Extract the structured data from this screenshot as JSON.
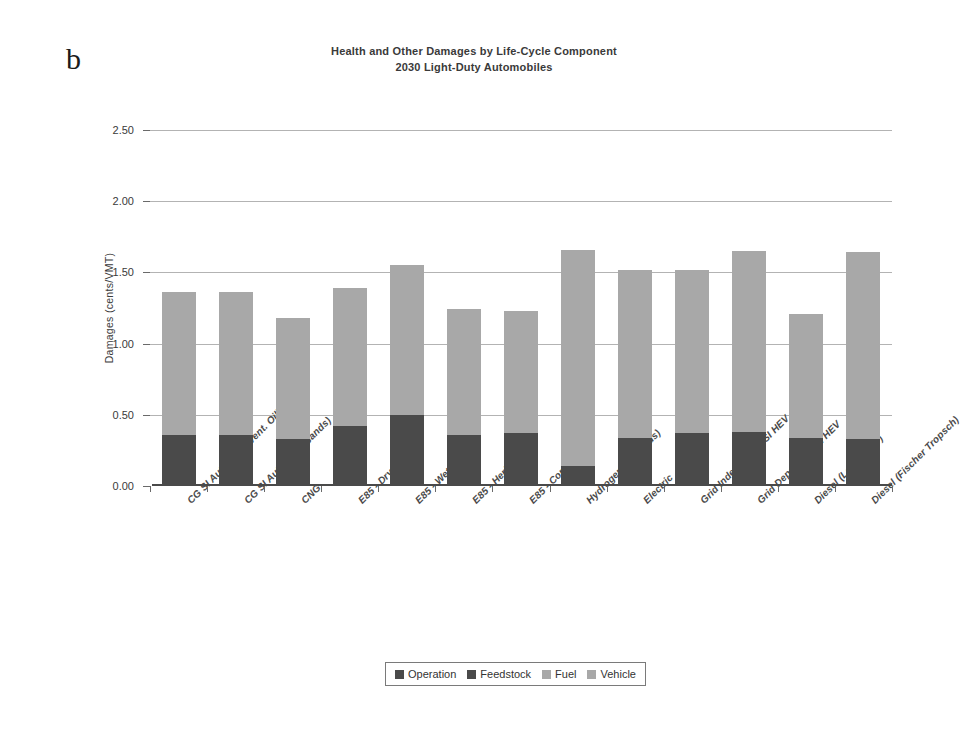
{
  "panel_label": "b",
  "title": {
    "line1": "Health and Other Damages by Life-Cycle Component",
    "line2": "2030 Light-Duty Automobiles"
  },
  "legend_position": "bottom-center",
  "chart_data": {
    "type": "bar",
    "subtype": "stacked-bar",
    "title": "Health and Other Damages by Life-Cycle Component\n2030 Light-Duty Automobiles",
    "xlabel": "",
    "ylabel": "Damages (cents/VMT)",
    "ylim": [
      0.0,
      2.5
    ],
    "ytick_labels": [
      "0.00",
      "0.50",
      "1.00",
      "1.50",
      "2.00",
      "2.50"
    ],
    "ytick_values": [
      0.0,
      0.5,
      1.0,
      1.5,
      2.0,
      2.5
    ],
    "grid": true,
    "grid_axis": "y",
    "legend": [
      "Operation",
      "Feedstock",
      "Fuel",
      "Vehicle"
    ],
    "colors": {
      "Operation": "#4a4a4a",
      "Feedstock": "#4a4a4a",
      "Fuel": "#a8a8a8",
      "Vehicle": "#a8a8a8",
      "gridline": "#9a9a9a",
      "axis": "#4a4a4a",
      "text": "#3a3a3a"
    },
    "categories": [
      "CG SI Autos (Convent. Oil)",
      "CG SI Autos (Tar Sands)",
      "CNG",
      "E85 - Dry Corn",
      "E85 - Wet Corn",
      "E85 - Herbaceous",
      "E85 - Corn Stover",
      "Hydrogen (Gaseous)",
      "Electric",
      "Grid Independent SI HEV",
      "Grid Dependent SI HEV",
      "Diesel (Low Sulfur)",
      "Diesel (Fischer Tropsch)"
    ],
    "series": [
      {
        "name": "Operation",
        "values": [
          0.36,
          0.36,
          0.33,
          0.42,
          0.5,
          0.36,
          0.37,
          0.14,
          0.34,
          0.37,
          0.38,
          0.34,
          0.33
        ]
      },
      {
        "name": "Feedstock",
        "values": [
          0.0,
          0.0,
          0.0,
          0.0,
          0.0,
          0.0,
          0.0,
          0.0,
          0.0,
          0.0,
          0.0,
          0.0,
          0.0
        ]
      },
      {
        "name": "Fuel",
        "values": [
          0.0,
          0.0,
          0.0,
          0.0,
          0.0,
          0.0,
          0.0,
          0.0,
          0.0,
          0.0,
          0.0,
          0.0,
          0.0
        ]
      },
      {
        "name": "Vehicle",
        "values": [
          1.0,
          1.0,
          0.85,
          0.97,
          1.05,
          0.88,
          0.86,
          1.52,
          1.18,
          1.15,
          1.27,
          0.87,
          1.31
        ]
      }
    ],
    "totals": [
      1.36,
      1.36,
      1.18,
      1.39,
      1.55,
      1.24,
      1.23,
      1.66,
      1.52,
      1.52,
      1.65,
      1.21,
      1.64
    ]
  }
}
